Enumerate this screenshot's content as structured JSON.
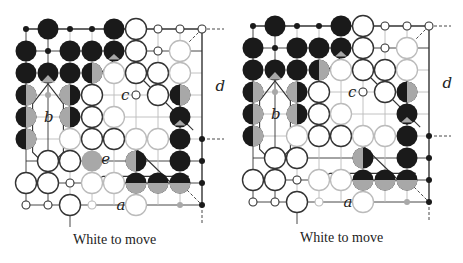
{
  "figure": {
    "type": "go-diagram-pair",
    "colors": {
      "black": "#1a1a1a",
      "white": "#ffffff",
      "gray": "#a8a8a8",
      "line": "#333333",
      "light_line": "#bbbbbb"
    },
    "diagrams": [
      {
        "caption": "White to move",
        "labels": [
          {
            "text": "b",
            "col": 1,
            "row": 4
          },
          {
            "text": "c",
            "col": 4.5,
            "row": 3
          },
          {
            "text": "d",
            "col": 8.8,
            "row": 2.6
          },
          {
            "text": "e",
            "col": 3.6,
            "row": 5.9
          },
          {
            "text": "a",
            "col": 4.3,
            "row": 8
          }
        ]
      },
      {
        "caption": "White to move",
        "labels": [
          {
            "text": "b",
            "col": 1,
            "row": 4
          },
          {
            "text": "c",
            "col": 4.5,
            "row": 3
          },
          {
            "text": "d",
            "col": 8.8,
            "row": 2.6
          },
          {
            "text": "a",
            "col": 4.3,
            "row": 8
          }
        ]
      }
    ],
    "board": {
      "cols": 9,
      "rows": 9,
      "stones": [
        [
          "bd",
          "B",
          "bd",
          "bd",
          "B",
          "W",
          "wd",
          "wd",
          "wd"
        ],
        [
          "B",
          "bd",
          "B",
          "B",
          "Bg",
          "W",
          "wd",
          "Wl",
          ""
        ],
        [
          "B",
          "Bt",
          "B",
          "Bgr",
          "Wl",
          "W",
          "W",
          "Wl",
          ""
        ],
        [
          "Bgr",
          "gd",
          "Bgl",
          "W",
          "",
          "wd",
          "W",
          "Bgr",
          ""
        ],
        [
          "Bgr",
          "",
          "Bgl",
          "W",
          "Wl",
          "",
          "",
          "Bg",
          ""
        ],
        [
          "Bgr",
          "",
          "Wl",
          "W",
          "W",
          "Wl",
          "Wl",
          "B",
          "bd"
        ],
        [
          "",
          "W",
          "W",
          "G",
          "",
          "Bgl",
          "",
          "B",
          "bd"
        ],
        [
          "W",
          "W",
          "wd",
          "Wl",
          "Wl",
          "Bgb",
          "Bgb",
          "Bgb",
          "bd"
        ],
        [
          "wd",
          "wd",
          "W",
          "wdl",
          "",
          "Wl",
          "",
          "gd",
          "bd"
        ]
      ]
    }
  }
}
